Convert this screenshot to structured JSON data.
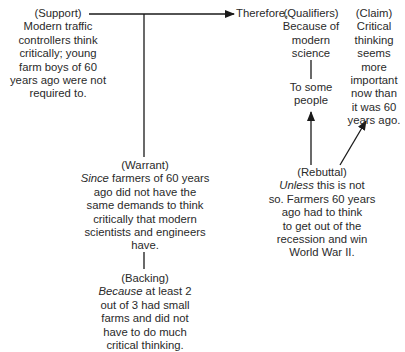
{
  "diagram": {
    "type": "Toulmin argument model",
    "support": {
      "label": "(Support)",
      "lines": [
        "Modern traffic",
        "controllers think",
        "critically; young",
        "farm boys of 60",
        "years ago were not",
        "required to."
      ]
    },
    "therefore": "Therefore,",
    "qualifiers": {
      "label": "(Qualifiers)",
      "lines": [
        "Because of",
        "modern",
        "science"
      ],
      "secondary_lines": [
        "To some",
        "people"
      ]
    },
    "claim": {
      "label": "(Claim)",
      "lines": [
        "Critical",
        "thinking",
        "seems",
        "more",
        "important",
        "now than",
        "it was 60",
        "years ago."
      ]
    },
    "warrant": {
      "label": "(Warrant)",
      "lead_italic": "Since",
      "first_line_rest": " farmers of 60 years",
      "lines": [
        "ago did not have the",
        "same demands to think",
        "critically that modern",
        "scientists and engineers",
        "have."
      ]
    },
    "backing": {
      "label": "(Backing)",
      "lead_italic": "Because",
      "first_line_rest": " at least 2",
      "lines": [
        "out of 3 had small",
        "farms and did not",
        "have to do much",
        "critical thinking."
      ]
    },
    "rebuttal": {
      "label": "(Rebuttal)",
      "lead_italic": "Unless",
      "first_line_rest": " this is not",
      "lines": [
        "so. Farmers 60 years",
        "ago had to think",
        "to get out of the",
        "recession and win",
        "World War II."
      ]
    },
    "colors": {
      "text": "#2a2a2a",
      "line": "#1a1a1a",
      "background": "#ffffff"
    }
  }
}
